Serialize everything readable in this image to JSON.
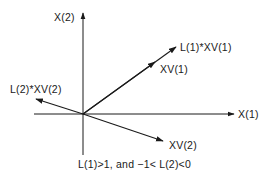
{
  "diagram": {
    "axes": {
      "x_label": "X(1)",
      "y_label": "X(2)"
    },
    "vectors": [
      {
        "label": "XV(1)",
        "role": "eigenvector 1"
      },
      {
        "label": "L(1)*XV(1)",
        "role": "scaled eigenvector 1"
      },
      {
        "label": "XV(2)",
        "role": "eigenvector 2"
      },
      {
        "label": "L(2)*XV(2)",
        "role": "scaled eigenvector 2"
      }
    ],
    "caption": "L(1)>1, and −1< L(2)<0",
    "colors": {
      "line": "#1a1a1a",
      "background": "#ffffff"
    }
  }
}
